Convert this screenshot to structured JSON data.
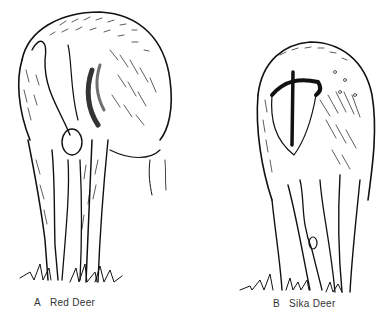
{
  "figure": {
    "panels": [
      {
        "letter": "A",
        "label": "Red Deer",
        "subject": "red-deer-rump-illustration"
      },
      {
        "letter": "B",
        "label": "Sika Deer",
        "subject": "sika-deer-rump-illustration"
      }
    ],
    "colors": {
      "ink": "#111111",
      "paper": "#ffffff",
      "caption": "#333333"
    }
  }
}
